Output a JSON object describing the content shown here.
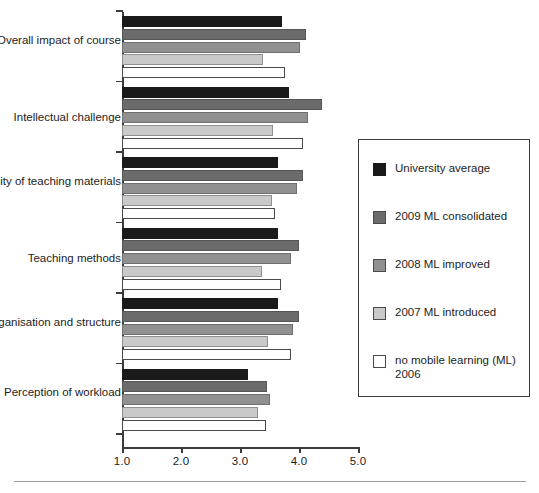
{
  "chart_data": {
    "type": "bar",
    "orientation": "horizontal",
    "title": "",
    "xlabel": "",
    "ylabel": "",
    "xlim": [
      1.0,
      5.0
    ],
    "xticks": [
      "1.0",
      "2.0",
      "3.0",
      "4.0",
      "5.0"
    ],
    "grid": false,
    "legend_position": "right",
    "categories": [
      "Overall impact of\ncourse",
      "Intellectual challenge",
      "Quality of teaching\nmaterials",
      "Teaching methods",
      "Organisation and\nstructure",
      "Perception of\nworkload"
    ],
    "series": [
      {
        "name": "University average",
        "color": "#1a1a1a",
        "values": [
          3.71,
          3.83,
          3.64,
          3.64,
          3.64,
          3.14
        ]
      },
      {
        "name": "2009 ML consolidated",
        "color": "#6b6b6b",
        "values": [
          4.12,
          4.39,
          4.07,
          4.0,
          4.0,
          3.46
        ]
      },
      {
        "name": "2008 ML improved",
        "color": "#909090",
        "values": [
          4.02,
          4.15,
          3.97,
          3.86,
          3.9,
          3.51
        ]
      },
      {
        "name": "2007 ML introduced",
        "color": "#c9c9c9",
        "values": [
          3.39,
          3.56,
          3.54,
          3.37,
          3.47,
          3.31
        ]
      },
      {
        "name": "no mobile learning (ML)\n2006",
        "color": "#ffffff",
        "values": [
          3.76,
          4.07,
          3.59,
          3.69,
          3.86,
          3.44
        ]
      }
    ]
  },
  "legend": {
    "entries": [
      "University average",
      "2009 ML consolidated",
      "2008 ML improved",
      "2007 ML introduced",
      "no mobile learning (ML)\n2006"
    ]
  }
}
